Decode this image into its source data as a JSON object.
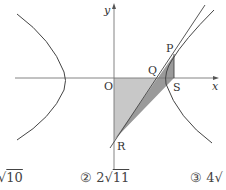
{
  "figure": {
    "axis_labels": {
      "x": "x",
      "y": "y"
    },
    "points": {
      "origin": "O",
      "P": "P",
      "Q": "Q",
      "R": "R",
      "S": "S"
    },
    "colors": {
      "curve": "#444444",
      "axis": "#777777",
      "shade_light": "#c8c8c8",
      "shade_dark": "#9a9a9a"
    }
  },
  "options": [
    {
      "number": "",
      "coefficient": "",
      "radicand": "10"
    },
    {
      "number": "②",
      "coefficient": "2",
      "radicand": "11"
    },
    {
      "number": "③",
      "coefficient": "4",
      "radicand": ""
    }
  ]
}
